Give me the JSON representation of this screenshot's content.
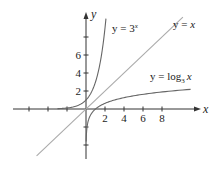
{
  "chart_data": {
    "type": "line",
    "title": "",
    "xlabel": "x",
    "ylabel": "y",
    "x_ticks": [
      2,
      4,
      6,
      8
    ],
    "y_ticks": [
      2,
      4,
      6
    ],
    "xlim": [
      -6,
      11
    ],
    "ylim": [
      -5,
      10.5
    ],
    "grid": false,
    "series": [
      {
        "name": "y = 3^x",
        "function": "3^x",
        "label_parts": {
          "lhs": "y = 3",
          "sup": "x"
        }
      },
      {
        "name": "y = x",
        "function": "x",
        "label_parts": {
          "lhs": "y = ",
          "var": "x"
        }
      },
      {
        "name": "y = log_3 x",
        "function": "log_3(x)",
        "label_parts": {
          "lhs": "y = log",
          "sub": "3",
          "var": "x"
        }
      }
    ],
    "annotations": [
      "y = 3^x",
      "y = x",
      "y = log_3 x"
    ]
  },
  "axes": {
    "x_label": "x",
    "y_label": "y",
    "x_tick_labels": [
      "2",
      "4",
      "6",
      "8"
    ],
    "y_tick_labels": [
      "2",
      "4",
      "6"
    ]
  },
  "labels": {
    "exp": {
      "text": "y = 3",
      "sup": "x"
    },
    "identity": {
      "text": "y = ",
      "var": "x"
    },
    "log": {
      "text": "y = log",
      "sub": "3",
      "var": "x"
    }
  },
  "colors": {
    "axes": "#333333",
    "exp_curve": "#666666",
    "log_curve": "#666666",
    "identity_line": "#aaaaaa",
    "text": "#222222"
  }
}
